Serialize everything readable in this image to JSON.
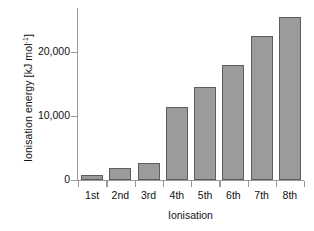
{
  "chart_data": {
    "type": "bar",
    "title": "",
    "xlabel": "Ionisation",
    "ylabel": "Ionisation energy [kJ mol⁻¹]",
    "ylabel_main": "Ionisation energy [kJ mol",
    "ylabel_sup": "-1",
    "ylabel_tail": "]",
    "categories": [
      "1st",
      "2nd",
      "3rd",
      "4th",
      "5th",
      "6th",
      "7th",
      "8th"
    ],
    "values": [
      800,
      2000,
      2800,
      11700,
      14800,
      18400,
      23000,
      26000
    ],
    "ylim": [
      0,
      27500
    ],
    "yticks": [
      0,
      10000,
      20000
    ],
    "ytick_labels": [
      "0",
      "10,000",
      "20,000"
    ],
    "grid": false,
    "legend": null,
    "bar_color": "#9b9b9b",
    "bar_edge_color": "#5d5d5d",
    "axis_color": "#9a9a9a",
    "text_color": "#111111"
  }
}
